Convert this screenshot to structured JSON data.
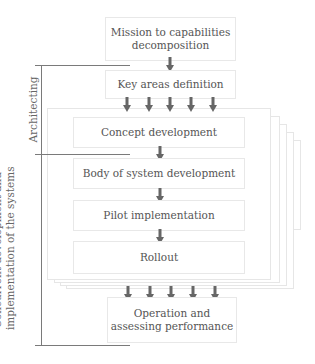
{
  "diagram": {
    "top_box": {
      "line1": "Mission to capabilities",
      "line2": "decomposition"
    },
    "key_areas_box": {
      "label": "Key areas definition"
    },
    "inner_steps": [
      {
        "label": "Concept development"
      },
      {
        "label": "Body of system development"
      },
      {
        "label": "Pilot implementation"
      },
      {
        "label": "Rollout"
      }
    ],
    "bottom_box": {
      "line1": "Operation and",
      "line2": "assessing performance"
    },
    "phase_labels": {
      "architecting": "Architecting",
      "concurrent_line1": "Concurrent development and",
      "concurrent_line2": "implementation of the systems"
    },
    "parallel_stack_count": 5,
    "colors": {
      "arrow": "#666666",
      "box_border": "#e8e8e8",
      "bracket_line": "#7a7a7a",
      "text": "#555555"
    }
  }
}
